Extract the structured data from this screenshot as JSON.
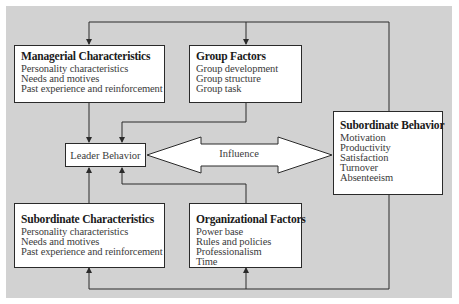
{
  "diagram": {
    "nodes": {
      "managerial": {
        "title": "Managerial Characteristics",
        "items": [
          "Personality characteristics",
          "Needs and motives",
          "Past experience and reinforcement"
        ]
      },
      "group": {
        "title": "Group Factors",
        "items": [
          "Group development",
          "Group structure",
          "Group task"
        ]
      },
      "leader": {
        "title": "Leader Behavior"
      },
      "subordinate_behavior": {
        "title": "Subordinate Behavior",
        "items": [
          "Motivation",
          "Productivity",
          "Satisfaction",
          "Turnover",
          "Absenteeism"
        ]
      },
      "subordinate_chars": {
        "title": "Subordinate Characteristics",
        "items": [
          "Personality characteristics",
          "Needs and motives",
          "Past experience and reinforcement"
        ]
      },
      "organizational": {
        "title": "Organizational Factors",
        "items": [
          "Power base",
          "Rules and policies",
          "Professionalism",
          "Time"
        ]
      }
    },
    "edges": [
      {
        "from": "managerial",
        "to": "leader"
      },
      {
        "from": "group",
        "to": "leader"
      },
      {
        "from": "subordinate_chars",
        "to": "leader"
      },
      {
        "from": "organizational",
        "to": "leader"
      },
      {
        "from": "leader",
        "to": "subordinate_behavior",
        "label": "Influence",
        "bidirectional": true
      },
      {
        "from": "subordinate_behavior",
        "to": "managerial",
        "type": "feedback"
      },
      {
        "from": "subordinate_behavior",
        "to": "group",
        "type": "feedback"
      },
      {
        "from": "subordinate_behavior",
        "to": "subordinate_chars",
        "type": "feedback"
      },
      {
        "from": "subordinate_behavior",
        "to": "organizational",
        "type": "feedback"
      }
    ],
    "influence_label": "Influence",
    "colors": {
      "background": "#d2d2d2",
      "box": "#ffffff",
      "line": "#2a2a2a"
    }
  }
}
